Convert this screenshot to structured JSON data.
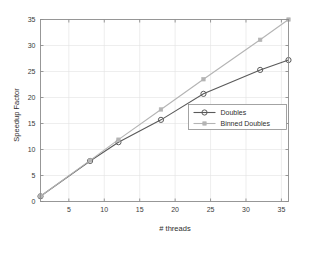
{
  "chart_data": {
    "type": "line",
    "title": "",
    "xlabel": "# threads",
    "ylabel": "Speedup Factor",
    "xlim": [
      1,
      36
    ],
    "ylim": [
      0,
      35
    ],
    "xticks": [
      5,
      10,
      15,
      20,
      25,
      30,
      35
    ],
    "xtick_labels": [
      "5",
      "10",
      "15",
      "20",
      "25",
      "30",
      "35"
    ],
    "yticks": [
      0,
      5,
      10,
      15,
      20,
      25,
      30,
      35
    ],
    "ytick_labels": [
      "0",
      "5",
      "10",
      "15",
      "20",
      "25",
      "30",
      "35"
    ],
    "grid": true,
    "legend_position": "center-right",
    "series": [
      {
        "name": "Doubles",
        "color": "#5a5a5a",
        "marker": "circle",
        "x": [
          1,
          8,
          12,
          18,
          24,
          32,
          36
        ],
        "values": [
          1.0,
          7.8,
          11.4,
          15.7,
          20.7,
          25.3,
          27.2
        ]
      },
      {
        "name": "Binned Doubles",
        "color": "#b4b4b4",
        "marker": "square",
        "x": [
          1,
          8,
          12,
          18,
          24,
          32,
          36
        ],
        "values": [
          1.0,
          7.9,
          11.9,
          17.7,
          23.5,
          31.1,
          35.0
        ]
      }
    ]
  },
  "legend": {
    "entries": [
      {
        "label": "Doubles"
      },
      {
        "label": "Binned Doubles"
      }
    ]
  },
  "axes": {
    "x_title": "# threads",
    "y_title": "Speedup Factor"
  }
}
